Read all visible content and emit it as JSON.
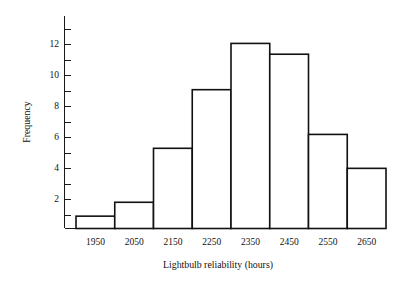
{
  "chart_data": {
    "type": "bar",
    "title": "",
    "subtitle": "",
    "xlabel": "Lightbulb reliability (hours)",
    "ylabel": "Frequency",
    "categories": [
      "1950",
      "2050",
      "2150",
      "2250",
      "2350",
      "2450",
      "2550",
      "2650"
    ],
    "values": [
      0.8,
      1.7,
      5.2,
      9.0,
      12.0,
      11.3,
      6.1,
      3.9
    ],
    "bin_width": 100,
    "bin_edges": [
      1900,
      2000,
      2100,
      2200,
      2300,
      2400,
      2500,
      2600,
      2700
    ],
    "xlim": [
      1900,
      2700
    ],
    "ylim": [
      0,
      13
    ],
    "ytick_major": [
      2,
      4,
      6,
      8,
      10,
      12
    ],
    "ytick_minor": [
      1,
      3,
      5,
      7,
      9,
      11,
      13
    ],
    "ytick_labels": [
      "2",
      "4",
      "6",
      "8",
      "10",
      "12"
    ],
    "xtick_labels": [
      "1950",
      "2050",
      "2150",
      "2250",
      "2350",
      "2450",
      "2550",
      "2650"
    ],
    "grid": false,
    "legend": false,
    "legend_position": "none",
    "bar_fill_color": "#ffffff",
    "bar_edge_color": "#111111",
    "axis_color": "#1a1a1a",
    "background_color": "#ffffff",
    "series": [
      {
        "name": "Frequency",
        "values": [
          0.8,
          1.7,
          5.2,
          9.0,
          12.0,
          11.3,
          6.1,
          3.9
        ]
      }
    ]
  },
  "figure": {
    "x_axis_title": "Lightbulb reliability (hours)",
    "y_axis_title": "Frequency"
  }
}
